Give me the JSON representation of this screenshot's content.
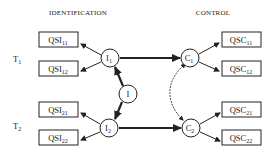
{
  "headers": {
    "left": "IDENTIFICATION",
    "right": "CONTROL"
  },
  "time_labels": [
    {
      "main": "T",
      "sub": "1"
    },
    {
      "main": "T",
      "sub": "2"
    }
  ],
  "identification_boxes": [
    {
      "main": "QSI",
      "sub": "11"
    },
    {
      "main": "QSI",
      "sub": "12"
    },
    {
      "main": "QSI",
      "sub": "21"
    },
    {
      "main": "QSI",
      "sub": "22"
    }
  ],
  "control_boxes": [
    {
      "main": "QSC",
      "sub": "11"
    },
    {
      "main": "QSC",
      "sub": "12"
    },
    {
      "main": "QSC",
      "sub": "21"
    },
    {
      "main": "QSC",
      "sub": "22"
    }
  ],
  "nodes": {
    "i1": {
      "main": "I",
      "sub": "1"
    },
    "i": {
      "main": "I",
      "sub": ""
    },
    "i2": {
      "main": "I",
      "sub": "2"
    },
    "c1": {
      "main": "C",
      "sub": "1"
    },
    "c2": {
      "main": "C",
      "sub": "2"
    }
  },
  "colors": {
    "stroke": "#222222",
    "background": "#ffffff"
  }
}
